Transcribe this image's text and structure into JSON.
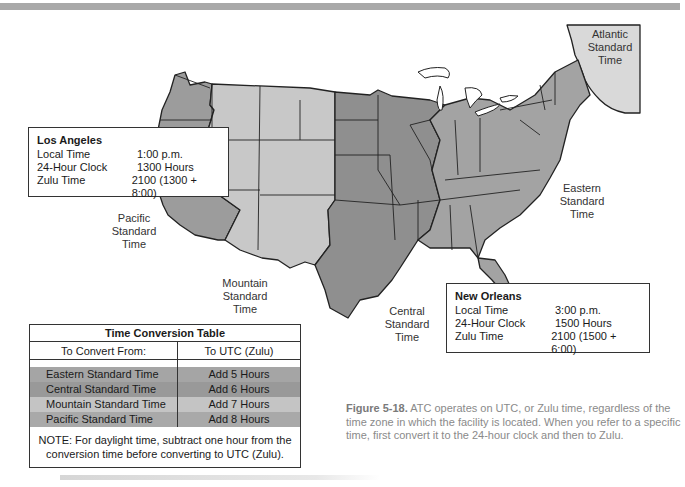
{
  "figure": {
    "number": "Figure 5-18.",
    "caption": "ATC operates on UTC, or Zulu time, regardless of the time zone in which the facility is located. When you refer to a specific time, first convert it to the 24-hour clock and then to Zulu."
  },
  "zones": {
    "atlantic": [
      "Atlantic",
      "Standard",
      "Time"
    ],
    "eastern": [
      "Eastern",
      "Standard",
      "Time"
    ],
    "central": [
      "Central",
      "Standard",
      "Time"
    ],
    "mountain": [
      "Mountain",
      "Standard",
      "Time"
    ],
    "pacific": [
      "Pacific",
      "Standard",
      "Time"
    ]
  },
  "zone_colors": {
    "pacific": "#9c9c9c",
    "mountain": "#c8c8c8",
    "central": "#8f8f8f",
    "eastern": "#a3a3a3",
    "atlantic": "#d9d9d9",
    "lakes": "#ffffff",
    "borders": "#222222"
  },
  "los_angeles": {
    "name": "Los Angeles",
    "rows": [
      {
        "label": "Local Time",
        "value": "1:00 p.m."
      },
      {
        "label": "24-Hour Clock",
        "value": "1300 Hours"
      },
      {
        "label": "Zulu Time",
        "value": "2100 (1300 + 8:00)"
      }
    ]
  },
  "new_orleans": {
    "name": "New Orleans",
    "rows": [
      {
        "label": "Local Time",
        "value": "3:00 p.m."
      },
      {
        "label": "24-Hour Clock",
        "value": "1500 Hours"
      },
      {
        "label": "Zulu Time",
        "value": "2100 (1500 + 6:00)"
      }
    ]
  },
  "conversion_table": {
    "title": "Time Conversion Table",
    "headers": [
      "To Convert From:",
      "To UTC (Zulu)"
    ],
    "rows": [
      {
        "from": "Eastern Standard Time",
        "to": "Add 5 Hours",
        "color": "#a5a5a5"
      },
      {
        "from": "Central Standard Time",
        "to": "Add 6 Hours",
        "color": "#999999"
      },
      {
        "from": "Mountain Standard Time",
        "to": "Add 7 Hours",
        "color": "#c4c4c4"
      },
      {
        "from": "Pacific Standard Time",
        "to": "Add 8 Hours",
        "color": "#a9a9a9"
      }
    ],
    "note": "NOTE: For daylight time, subtract one hour from the conversion time before converting to UTC (Zulu)."
  }
}
